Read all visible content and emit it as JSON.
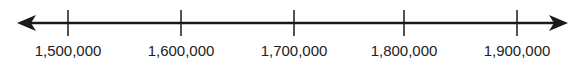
{
  "number_line": {
    "min_arrow": true,
    "max_arrow": true,
    "line_color": "#1a1a1a",
    "ticks": [
      {
        "value": 1500000,
        "label": "1,500,000",
        "x": 68
      },
      {
        "value": 1600000,
        "label": "1,600,000",
        "x": 181
      },
      {
        "value": 1700000,
        "label": "1,700,000",
        "x": 294
      },
      {
        "value": 1800000,
        "label": "1,800,000",
        "x": 404
      },
      {
        "value": 1900000,
        "label": "1,900,000",
        "x": 517
      }
    ]
  }
}
